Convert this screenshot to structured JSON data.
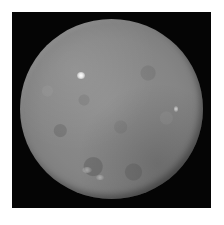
{
  "image": {
    "subject": "cratered spherical body (dwarf planet) on black background",
    "background_color": "#050505",
    "page_color": "#ffffff",
    "surface_color": "#858585",
    "features": [
      {
        "name": "bright-spot-main",
        "description": "bright white spot upper-left"
      },
      {
        "name": "bright-spot-secondary",
        "description": "faint bright spot right side"
      },
      {
        "name": "craters-lower",
        "description": "lighter crater rims near bottom"
      }
    ]
  }
}
